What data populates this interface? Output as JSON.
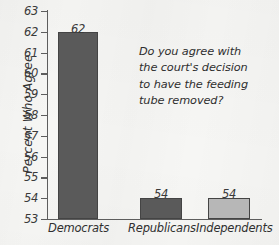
{
  "chart_data": {
    "type": "bar",
    "title": "",
    "xlabel": "",
    "ylabel": "Percent Who Agree",
    "ylim": [
      53,
      63
    ],
    "grid": false,
    "legend": "none",
    "categories": [
      "Democrats",
      "Republicans",
      "Independents"
    ],
    "values": [
      62,
      54,
      54
    ],
    "value_labels": [
      "62",
      "54",
      "54"
    ],
    "bar_colors": [
      "#5a5a5a",
      "#5a5a5a",
      "#b7b7b7"
    ],
    "yticks": [
      "63",
      "62",
      "61",
      "60",
      "59",
      "58",
      "57",
      "56",
      "55",
      "54",
      "53"
    ],
    "annotation_lines": [
      "Do you agree with",
      "the court's decision",
      "to have the feeding",
      "tube removed?"
    ],
    "annotation_text": "Do you agree with the court's decision to have the feeding tube removed?"
  },
  "colors": {
    "background": "#f6f6f4",
    "axis": "#5d5d5d",
    "bar_dark": "#5a5a5a",
    "bar_light": "#b7b7b7",
    "bar_outline": "#444444",
    "text": "#2f2f2f"
  }
}
